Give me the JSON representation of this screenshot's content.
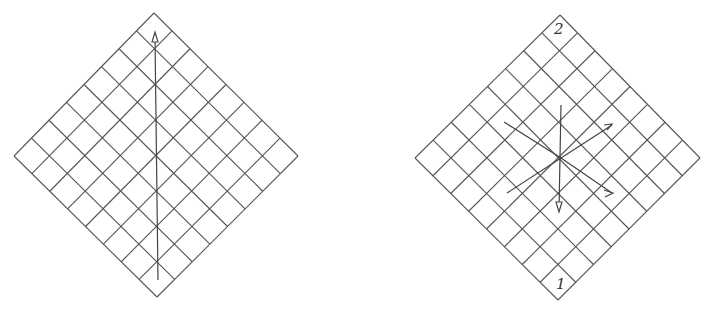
{
  "figures": [
    {
      "id": "left",
      "grid": "8x8 diamond lattice",
      "arrows": [
        "vertical upward arrow through center"
      ]
    },
    {
      "id": "right",
      "grid": "8x8 diamond lattice",
      "labels": {
        "top": "2",
        "bottom": "1"
      },
      "arrows": [
        "down",
        "up-right",
        "down-right",
        "line up-left",
        "line down-left"
      ]
    }
  ],
  "labels": {
    "top": "2",
    "bottom": "1"
  },
  "colors": {
    "ink": "#444444",
    "background": "#ffffff"
  }
}
